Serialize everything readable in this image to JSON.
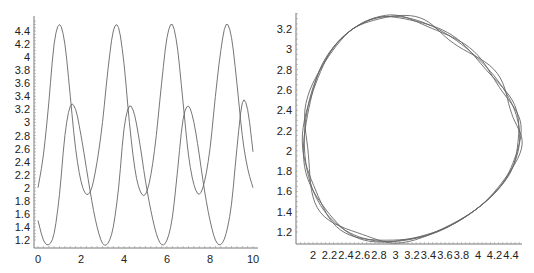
{
  "chart_data": [
    {
      "type": "line",
      "title": "",
      "xlabel": "",
      "ylabel": "",
      "xlim": [
        0,
        10
      ],
      "ylim": [
        1.1,
        4.55
      ],
      "x_ticks": [
        "0",
        "2",
        "4",
        "6",
        "8",
        "10"
      ],
      "y_ticks": [
        "1.2",
        "1.4",
        "1.6",
        "1.8",
        "2",
        "2.2",
        "2.4",
        "2.6",
        "2.8",
        "3",
        "3.2",
        "3.4",
        "3.6",
        "3.8",
        "4",
        "4.2",
        "4.4"
      ],
      "grid": false,
      "legend": null,
      "x": [
        0,
        0.25,
        0.5,
        0.75,
        1.0,
        1.25,
        1.5,
        1.75,
        2.0,
        2.25,
        2.5,
        2.75,
        3.0,
        3.25,
        3.5,
        3.75,
        4.0,
        4.25,
        4.5,
        4.75,
        5.0,
        5.25,
        5.5,
        5.75,
        6.0,
        6.25,
        6.5,
        6.75,
        7.0,
        7.25,
        7.5,
        7.75,
        8.0,
        8.25,
        8.5,
        8.75,
        9.0,
        9.25,
        9.5,
        9.75,
        10.0
      ],
      "series": [
        {
          "name": "series-1",
          "values": [
            2.0,
            2.5,
            3.3,
            4.2,
            4.5,
            4.2,
            3.4,
            2.6,
            2.1,
            1.9,
            2.0,
            2.4,
            3.0,
            3.8,
            4.4,
            4.45,
            3.9,
            3.0,
            2.3,
            1.95,
            1.9,
            2.2,
            2.8,
            3.6,
            4.3,
            4.5,
            4.1,
            3.3,
            2.5,
            2.05,
            1.9,
            2.1,
            2.6,
            3.4,
            4.1,
            4.5,
            4.3,
            3.6,
            2.8,
            2.3,
            2.0
          ]
        },
        {
          "name": "series-2",
          "values": [
            1.5,
            1.2,
            1.13,
            1.3,
            1.9,
            2.8,
            3.25,
            3.2,
            2.8,
            2.3,
            1.8,
            1.4,
            1.15,
            1.15,
            1.4,
            2.0,
            2.9,
            3.25,
            3.1,
            2.65,
            2.1,
            1.65,
            1.3,
            1.13,
            1.2,
            1.55,
            2.3,
            3.05,
            3.25,
            3.0,
            2.5,
            1.95,
            1.5,
            1.2,
            1.13,
            1.3,
            1.75,
            2.6,
            3.3,
            3.2,
            2.55
          ]
        }
      ]
    },
    {
      "type": "line",
      "title": "",
      "xlabel": "",
      "ylabel": "",
      "xlim": [
        1.8,
        4.55
      ],
      "ylim": [
        1.1,
        3.3
      ],
      "x_ticks": [
        "2",
        "2.2",
        "2.4",
        "2.6",
        "2.8",
        "3",
        "3.2",
        "3.4",
        "3.6",
        "3.8",
        "4",
        "4.2",
        "4.4"
      ],
      "y_ticks": [
        "1.2",
        "1.4",
        "1.6",
        "1.8",
        "2",
        "2.2",
        "2.4",
        "2.6",
        "2.8",
        "3",
        "3.2"
      ],
      "grid": false,
      "legend": null,
      "description": "phase portrait: series-2 vs series-1, closed loop traced ~4 times",
      "loop": {
        "x_min": 1.9,
        "x_max": 4.5,
        "y_min": 1.13,
        "y_max": 3.3
      }
    }
  ]
}
